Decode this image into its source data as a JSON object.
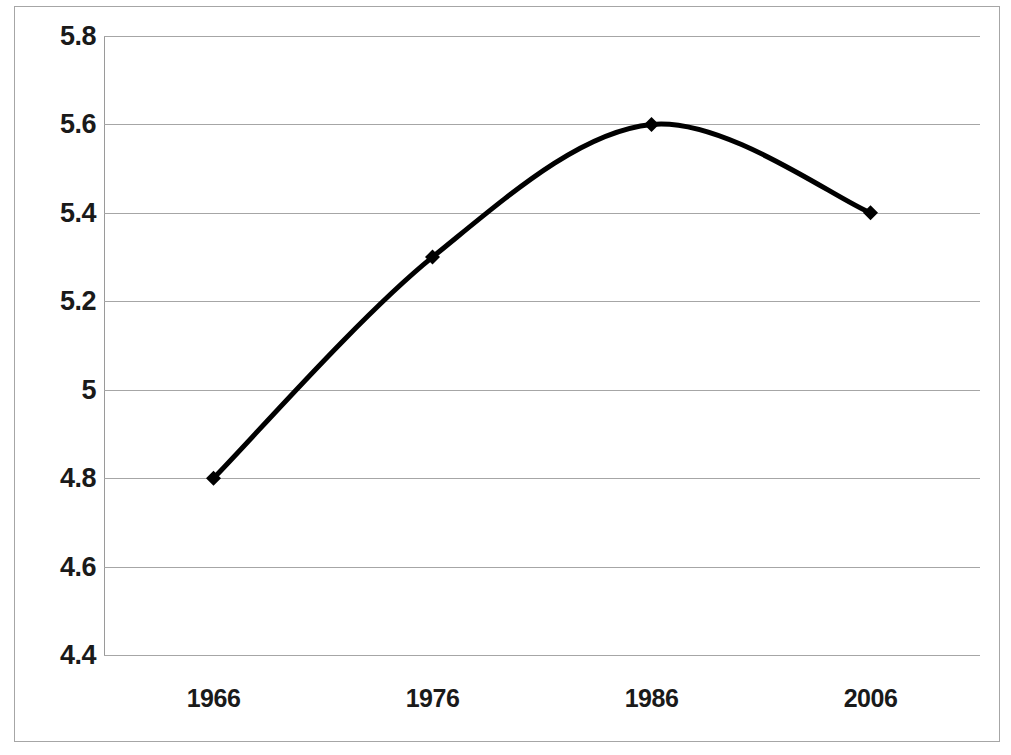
{
  "chart_data": {
    "type": "line",
    "title": "",
    "subtitle": "",
    "xlabel": "",
    "ylabel": "",
    "categories": [
      "1966",
      "1976",
      "1986",
      "2006"
    ],
    "x": [
      1966,
      1976,
      1986,
      2006
    ],
    "values": [
      4.8,
      5.3,
      5.6,
      5.4
    ],
    "series": [
      {
        "name": "Series 1",
        "values": [
          4.8,
          5.3,
          5.6,
          5.4
        ]
      }
    ],
    "ylim": [
      4.4,
      5.8
    ],
    "ytick_labels": [
      "5.8",
      "5.6",
      "5.4",
      "5.2",
      "5",
      "4.8",
      "4.6",
      "4.4"
    ],
    "ytick_values": [
      5.8,
      5.6,
      5.4,
      5.2,
      5.0,
      4.8,
      4.6,
      4.4
    ],
    "xtick_labels": [
      "1966",
      "1976",
      "1986",
      "2006"
    ],
    "grid": true,
    "grid_axis": "y",
    "legend": false,
    "legend_position": "none",
    "smoothed": true,
    "marker": "diamond",
    "annotations": [],
    "colors": {
      "line": "#000000",
      "marker": "#000000",
      "gridline": "#a6a6a6",
      "frame": "#a6a6a6",
      "text": "#1a1a1a",
      "background": "#ffffff"
    },
    "line_width": 5
  }
}
